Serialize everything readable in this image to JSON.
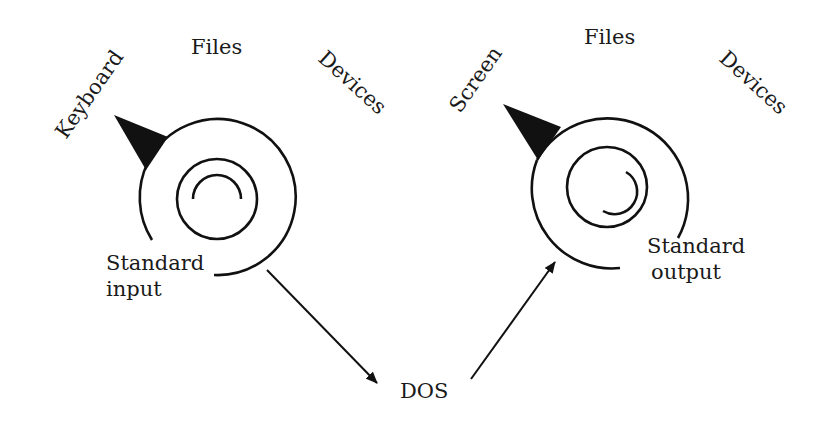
{
  "diagram": {
    "input_spiral": {
      "labels": {
        "left": "Keyboard",
        "top": "Files",
        "right": "Devices",
        "caption_line1": "Standard",
        "caption_line2": "input"
      }
    },
    "output_spiral": {
      "labels": {
        "left": "Screen",
        "top": "Files",
        "right": "Devices",
        "caption_line1": "Standard",
        "caption_line2": "output"
      }
    },
    "center": {
      "label": "DOS"
    },
    "edges": [
      {
        "from": "Standard input",
        "to": "DOS"
      },
      {
        "from": "DOS",
        "to": "Standard output"
      }
    ],
    "colors": {
      "stroke": "#111111",
      "background": "#ffffff"
    }
  }
}
